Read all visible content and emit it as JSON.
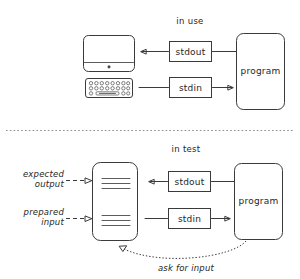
{
  "diagram": {
    "title_alt": "stdin and stdout in use versus in test",
    "sections": [
      {
        "id": "in-use",
        "label": "in use",
        "nodes": {
          "display": "monitor",
          "keyboard": "keyboard",
          "stdout_label": "stdout",
          "stdin_label": "stdin",
          "program_label": "program"
        }
      },
      {
        "id": "in-test",
        "label": "in test",
        "nodes": {
          "document": "test-file",
          "expected_output_label": "expected\noutput",
          "expected_output_line1": "expected",
          "expected_output_line2": "output",
          "prepared_input_line1": "prepared",
          "prepared_input_line2": "input",
          "stdout_label": "stdout",
          "stdin_label": "stdin",
          "program_label": "program",
          "feedback_label": "ask for input"
        }
      }
    ],
    "colors": {
      "ink": "#3a3a3a",
      "text": "#262626",
      "divider": "#8d8d8d",
      "paper": "#ffffff"
    }
  }
}
